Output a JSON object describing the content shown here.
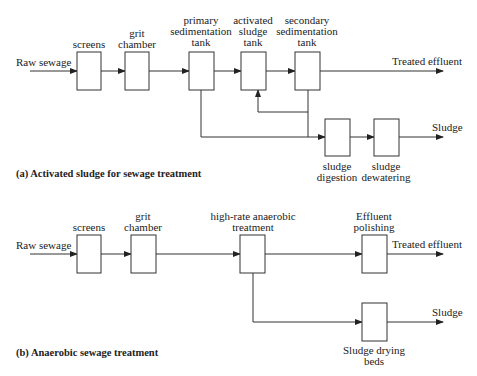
{
  "diagram_a": {
    "caption": "(a) Activated sludge for sewage treatment",
    "input_label": "Raw sewage",
    "output_effluent_label": "Treated effluent",
    "output_sludge_label": "Sludge",
    "units": [
      {
        "id": "screens",
        "label": "screens"
      },
      {
        "id": "grit_chamber",
        "label": "grit\nchamber"
      },
      {
        "id": "primary_sedimentation_tank",
        "label": "primary\nsedimentation\ntank"
      },
      {
        "id": "activated_sludge_tank",
        "label": "activated\nsludge\ntank"
      },
      {
        "id": "secondary_sedimentation_tank",
        "label": "secondary\nsedimentation\ntank"
      },
      {
        "id": "sludge_digestion",
        "label": "sludge\ndigestion"
      },
      {
        "id": "sludge_dewatering",
        "label": "sludge\ndewatering"
      }
    ]
  },
  "diagram_b": {
    "caption": "(b) Anaerobic sewage treatment",
    "input_label": "Raw sewage",
    "output_effluent_label": "Treated effluent",
    "output_sludge_label": "Sludge",
    "units": [
      {
        "id": "screens",
        "label": "screens"
      },
      {
        "id": "grit_chamber",
        "label": "grit\nchamber"
      },
      {
        "id": "high_rate_anaerobic_treatment",
        "label": "high-rate anaerobic\ntreatment"
      },
      {
        "id": "effluent_polishing",
        "label": "Effluent\npolishing"
      },
      {
        "id": "sludge_drying_beds",
        "label": "Sludge drying\nbeds"
      }
    ]
  }
}
